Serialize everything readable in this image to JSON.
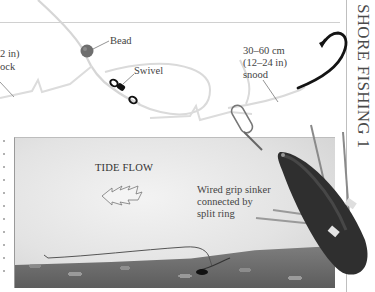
{
  "page": {
    "header": "SHORE FISHING 1"
  },
  "diagram": {
    "labels": {
      "shock_line1": "2 in)",
      "shock_line2": "ock",
      "bead": "Bead",
      "swivel": "Swivel",
      "snood_line1": "30–60 cm",
      "snood_line2": "(12–24 in)",
      "snood_line3": "snood",
      "tide_flow": "TIDE FLOW",
      "sinker_line1": "Wired grip sinker",
      "sinker_line2": "connected by",
      "sinker_line3": "split ring"
    },
    "colors": {
      "line": "#d8d8d8",
      "bead": "#6b6b6b",
      "sinker": "#2e2e2e",
      "hook": "#1a1a1a",
      "header_text": "#4a4a4a"
    },
    "icons": [
      "hook-icon",
      "bead-icon",
      "swivel-icon",
      "clip-icon",
      "sinker-icon",
      "tide-arrow-icon"
    ]
  }
}
